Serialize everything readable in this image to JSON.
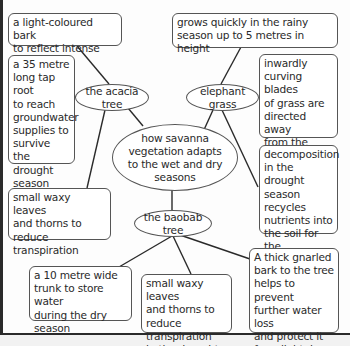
{
  "diagram": {
    "type": "spider-diagram",
    "central_topic": "how savanna\nvegetation adapts\nto the wet and dry\nseasons",
    "branches": [
      {
        "label": "the acacia tree",
        "facts": [
          "a light-coloured bark\nto reflect intense heat",
          "a 35 metre\nlong tap root\nto reach\ngroundwater\nsupplies to\nsurvive the\ndrought\nseason",
          "small waxy leaves\nand thorns to\nreduce transpiration"
        ]
      },
      {
        "label": "elephant grass",
        "facts": [
          "grows quickly in the rainy\nseason up to 5 metres in height",
          "inwardly\ncurving blades\nof grass are\ndirected away\nfrom the most\nintense sunlight",
          "decomposition\nin the drought\nseason recycles\nnutrients into\nthe soil for the\nfollowing year"
        ]
      },
      {
        "label": "the baobab tree",
        "facts": [
          "a 10 metre wide\ntrunk to store water\nduring the dry\nseason",
          "small waxy leaves\nand thorns to\nreduce transpiration\nin the drought",
          "A thick gnarled\nbark to the tree\nhelps to prevent\nfurther water loss\nand protect it\nfrom lightning"
        ]
      }
    ]
  },
  "colors": {
    "line": "#2a2a2a",
    "border": "#555555",
    "text": "#2a2a2a",
    "background": "#ffffff"
  }
}
